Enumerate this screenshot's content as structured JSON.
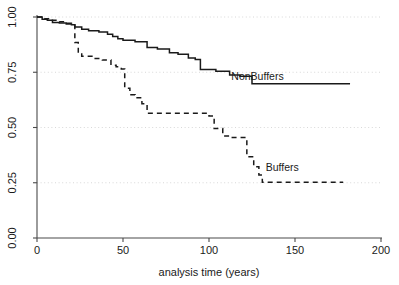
{
  "chart_data": {
    "type": "line",
    "subtype": "kaplan-meier-step",
    "title": "",
    "xlabel": "analysis time (years)",
    "ylabel": "",
    "xlim": [
      0,
      200
    ],
    "ylim": [
      0,
      1
    ],
    "xticks": [
      0,
      50,
      100,
      150,
      200
    ],
    "xtick_labels": [
      "0",
      "50",
      "100",
      "150",
      "200"
    ],
    "yticks": [
      0.0,
      0.25,
      0.5,
      0.75,
      1.0
    ],
    "ytick_labels": [
      "0.00",
      "0.25",
      "0.50",
      "0.75",
      "1.00"
    ],
    "grid": "horizontal-dotted",
    "legend": "inline-annotation",
    "series": [
      {
        "name": "NonBuffers",
        "style": "solid",
        "color": "#1a1a1a",
        "label_x": 113,
        "label_y": 0.715,
        "points": [
          [
            0,
            1.0
          ],
          [
            3,
            1.0
          ],
          [
            3,
            0.99
          ],
          [
            6,
            0.99
          ],
          [
            6,
            0.985
          ],
          [
            9,
            0.985
          ],
          [
            9,
            0.975
          ],
          [
            13,
            0.975
          ],
          [
            13,
            0.973
          ],
          [
            17,
            0.973
          ],
          [
            17,
            0.968
          ],
          [
            20,
            0.968
          ],
          [
            20,
            0.965
          ],
          [
            22,
            0.965
          ],
          [
            22,
            0.955
          ],
          [
            26,
            0.955
          ],
          [
            26,
            0.945
          ],
          [
            30,
            0.945
          ],
          [
            30,
            0.938
          ],
          [
            36,
            0.938
          ],
          [
            36,
            0.932
          ],
          [
            41,
            0.932
          ],
          [
            41,
            0.922
          ],
          [
            44,
            0.922
          ],
          [
            44,
            0.912
          ],
          [
            47,
            0.912
          ],
          [
            47,
            0.902
          ],
          [
            50,
            0.902
          ],
          [
            50,
            0.895
          ],
          [
            57,
            0.895
          ],
          [
            57,
            0.888
          ],
          [
            64,
            0.888
          ],
          [
            64,
            0.862
          ],
          [
            70,
            0.862
          ],
          [
            70,
            0.855
          ],
          [
            77,
            0.855
          ],
          [
            77,
            0.838
          ],
          [
            82,
            0.838
          ],
          [
            82,
            0.832
          ],
          [
            88,
            0.832
          ],
          [
            88,
            0.815
          ],
          [
            92,
            0.815
          ],
          [
            92,
            0.808
          ],
          [
            95,
            0.808
          ],
          [
            95,
            0.762
          ],
          [
            104,
            0.762
          ],
          [
            104,
            0.755
          ],
          [
            112,
            0.755
          ],
          [
            112,
            0.738
          ],
          [
            118,
            0.738
          ],
          [
            118,
            0.732
          ],
          [
            125,
            0.732
          ],
          [
            125,
            0.698
          ],
          [
            182,
            0.698
          ]
        ]
      },
      {
        "name": "Buffers",
        "style": "dashed",
        "color": "#1a1a1a",
        "label_x": 133,
        "label_y": 0.305,
        "points": [
          [
            0,
            1.0
          ],
          [
            4,
            1.0
          ],
          [
            4,
            0.992
          ],
          [
            8,
            0.992
          ],
          [
            8,
            0.985
          ],
          [
            12,
            0.985
          ],
          [
            12,
            0.978
          ],
          [
            16,
            0.978
          ],
          [
            16,
            0.972
          ],
          [
            20,
            0.972
          ],
          [
            20,
            0.968
          ],
          [
            22,
            0.968
          ],
          [
            22,
            0.885
          ],
          [
            24,
            0.885
          ],
          [
            24,
            0.838
          ],
          [
            26,
            0.838
          ],
          [
            26,
            0.822
          ],
          [
            33,
            0.822
          ],
          [
            33,
            0.812
          ],
          [
            38,
            0.812
          ],
          [
            38,
            0.805
          ],
          [
            43,
            0.805
          ],
          [
            43,
            0.782
          ],
          [
            46,
            0.782
          ],
          [
            46,
            0.775
          ],
          [
            49,
            0.775
          ],
          [
            49,
            0.765
          ],
          [
            51,
            0.765
          ],
          [
            51,
            0.678
          ],
          [
            54,
            0.678
          ],
          [
            54,
            0.648
          ],
          [
            57,
            0.648
          ],
          [
            57,
            0.635
          ],
          [
            61,
            0.635
          ],
          [
            61,
            0.608
          ],
          [
            64,
            0.608
          ],
          [
            64,
            0.565
          ],
          [
            100,
            0.565
          ],
          [
            100,
            0.552
          ],
          [
            103,
            0.552
          ],
          [
            103,
            0.495
          ],
          [
            108,
            0.495
          ],
          [
            108,
            0.462
          ],
          [
            112,
            0.462
          ],
          [
            112,
            0.455
          ],
          [
            122,
            0.455
          ],
          [
            122,
            0.368
          ],
          [
            126,
            0.368
          ],
          [
            126,
            0.322
          ],
          [
            129,
            0.322
          ],
          [
            129,
            0.285
          ],
          [
            131,
            0.285
          ],
          [
            131,
            0.252
          ],
          [
            178,
            0.252
          ]
        ]
      }
    ]
  },
  "axes": {
    "x_axis_title": "analysis time (years)"
  }
}
